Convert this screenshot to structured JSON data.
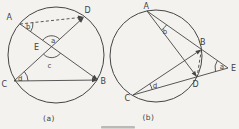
{
  "figure": {
    "ink_color": "#454545",
    "paper_color": "#f3f2ee",
    "caption_a": "(a)",
    "caption_b": "(b)",
    "diagram_a": {
      "description": "circle with chords AB and CD intersecting at interior point E; dashed chord AD; marked angles a, b, c, d",
      "vertex_labels": {
        "A": "A",
        "B": "B",
        "C": "C",
        "D": "D",
        "E": "E"
      },
      "angle_labels": {
        "a": "a",
        "b": "b",
        "c": "c",
        "d": "d"
      }
    },
    "diagram_b": {
      "description": "circle with secants EBA and EDC from external point E; chords AD and CB; dashed chord BD; marked angles a, b, d",
      "vertex_labels": {
        "A": "A",
        "B": "B",
        "C": "C",
        "D": "D",
        "E": "E"
      },
      "angle_labels": {
        "a": "a",
        "b": "b",
        "d": "d"
      }
    }
  }
}
